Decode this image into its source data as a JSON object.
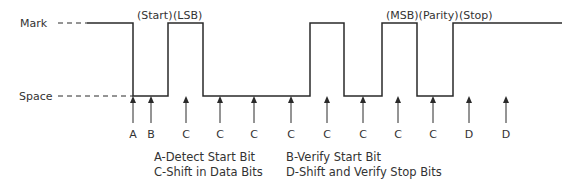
{
  "diagram": {
    "levels": {
      "mark": {
        "label": "Mark",
        "y": 23
      },
      "space": {
        "label": "Space",
        "y": 96
      }
    },
    "waveform": {
      "start_x": 87,
      "end_x": 562,
      "transitions": [
        133,
        168,
        203,
        310,
        344,
        382,
        417,
        453
      ],
      "initial_level": "mark"
    },
    "bit_labels": [
      {
        "text": "(Start)",
        "x": 137
      },
      {
        "text": "(LSB)",
        "x": 173
      },
      {
        "text": "(MSB)(Parity)",
        "x": 386
      },
      {
        "text": "(Stop)",
        "x": 459
      }
    ],
    "sample_points": [
      {
        "letter": "A",
        "x": 133
      },
      {
        "letter": "B",
        "x": 151
      },
      {
        "letter": "C",
        "x": 186
      },
      {
        "letter": "C",
        "x": 220
      },
      {
        "letter": "C",
        "x": 254
      },
      {
        "letter": "C",
        "x": 291
      },
      {
        "letter": "C",
        "x": 327
      },
      {
        "letter": "C",
        "x": 363
      },
      {
        "letter": "C",
        "x": 398
      },
      {
        "letter": "C",
        "x": 433
      },
      {
        "letter": "D",
        "x": 469
      },
      {
        "letter": "D",
        "x": 506
      }
    ],
    "legend": {
      "a": "A-Detect Start Bit",
      "b": "B-Verify Start Bit",
      "c": "C-Shift in Data Bits",
      "d": "D-Shift and Verify Stop Bits"
    },
    "colors": {
      "line": "#2a2a2a",
      "text": "#333333"
    }
  }
}
